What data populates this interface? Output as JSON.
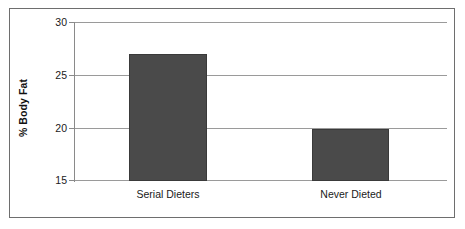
{
  "chart_data": {
    "type": "bar",
    "title": "",
    "xlabel": "",
    "ylabel": "% Body Fat",
    "categories": [
      "Serial Dieters",
      "Never Dieted"
    ],
    "values": [
      27.0,
      19.9
    ],
    "ylim": [
      15,
      30
    ],
    "yticks": [
      15,
      20,
      25,
      30
    ],
    "ytick_labels": [
      "15",
      "20",
      "25",
      "30"
    ],
    "grid": "horizontal",
    "legend": "none",
    "series": [
      {
        "name": "% Body Fat",
        "values": [
          27.0,
          19.9
        ],
        "color": "#4a4a4a"
      }
    ],
    "annotations": []
  },
  "axis": {
    "y_title": "% Body Fat",
    "tick_30": "30",
    "tick_25": "25",
    "tick_20": "20",
    "tick_15": "15",
    "cat_0": "Serial Dieters",
    "cat_1": "Never Dieted"
  },
  "colors": {
    "bar_fill": "#4a4a4a",
    "bar_edge": "#3a3a3a",
    "gridline": "#9a9a9a",
    "frame": "#6e6e6e",
    "text": "#1a1a1a",
    "background": "#ffffff"
  }
}
